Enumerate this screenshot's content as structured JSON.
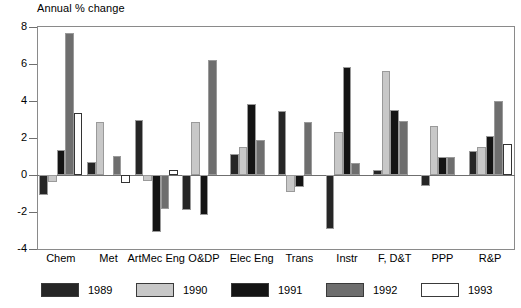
{
  "chart_data": {
    "type": "bar",
    "title": "",
    "ylabel": "Annual % change",
    "xlabel": "",
    "ylim": [
      -4,
      8
    ],
    "yticks": [
      8,
      6,
      4,
      2,
      0,
      -2,
      -4
    ],
    "grid": false,
    "legend_position": "bottom",
    "categories": [
      "Chem",
      "Met",
      "ArtMec Eng",
      "O&DP",
      "Elec Eng",
      "Trans",
      "Instr",
      "F, D&T",
      "PPP",
      "R&P"
    ],
    "series": [
      {
        "name": "1989",
        "color": "#262626",
        "values": [
          -1.1,
          0.7,
          3.0,
          -1.9,
          1.15,
          3.45,
          -2.9,
          0.25,
          -0.6,
          1.3
        ]
      },
      {
        "name": "1990",
        "color": "#c8c8c8",
        "values": [
          -0.4,
          2.85,
          -0.3,
          2.85,
          1.5,
          -0.9,
          2.35,
          5.6,
          2.65,
          1.5
        ]
      },
      {
        "name": "1991",
        "color": "#141414",
        "values": [
          1.35,
          0.0,
          -3.1,
          -2.15,
          3.85,
          -0.65,
          5.85,
          3.5,
          1.0,
          2.1
        ]
      },
      {
        "name": "1992",
        "color": "#6e6e6e",
        "values": [
          7.65,
          1.05,
          -1.85,
          6.2,
          1.9,
          2.85,
          0.65,
          2.9,
          1.0,
          4.0
        ]
      },
      {
        "name": "1993",
        "color": "#ffffff",
        "values": [
          3.35,
          -0.45,
          0.25,
          0.0,
          0.0,
          0.0,
          0.0,
          0.0,
          0.0,
          1.7
        ]
      }
    ]
  },
  "axis": {
    "y_title": "Annual % change",
    "tick_labels": [
      "8",
      "6",
      "4",
      "2",
      "0",
      "-2",
      "-4"
    ]
  },
  "legend": {
    "items": [
      {
        "label": "1989"
      },
      {
        "label": "1990"
      },
      {
        "label": "1991"
      },
      {
        "label": "1992"
      },
      {
        "label": "1993"
      }
    ]
  }
}
